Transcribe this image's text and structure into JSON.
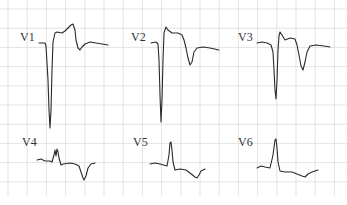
{
  "figure": {
    "type": "12-lead ECG excerpt (precordial leads)",
    "background_color": "#ffffff",
    "grid_color": "#dcdcdc",
    "trace_color": "#2a2a2a"
  },
  "leads": [
    {
      "id": "V1",
      "label": "V1",
      "morphology": "deep QS complex with ST elevation and T-wave inversion"
    },
    {
      "id": "V2",
      "label": "V2",
      "morphology": "deep QS complex, coved ST elevation, inverted T wave"
    },
    {
      "id": "V3",
      "label": "V3",
      "morphology": "QS complex with ST elevation and deep T inversion"
    },
    {
      "id": "V4",
      "label": "V4",
      "morphology": "notched small QRS with deep T-wave inversion"
    },
    {
      "id": "V5",
      "label": "V5",
      "morphology": "upright R wave, ST depression, T inversion"
    },
    {
      "id": "V6",
      "label": "V6",
      "morphology": "upright R wave, ST depression, shallow T inversion"
    }
  ]
}
